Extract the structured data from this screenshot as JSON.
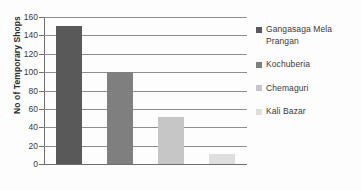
{
  "chart_data": {
    "type": "bar",
    "title": "",
    "xlabel": "",
    "ylabel": "No of Temporary Shops",
    "categories": [
      "Gangasaga Mela Prangan",
      "Kochuberia",
      "Chemaguri",
      "Kali Bazar"
    ],
    "values": [
      150,
      100,
      51,
      11
    ],
    "ylim": [
      0,
      160
    ],
    "yticks": [
      "0",
      "20",
      "40",
      "60",
      "80",
      "100",
      "120",
      "140",
      "160"
    ],
    "ytick_values": [
      0,
      20,
      40,
      60,
      80,
      100,
      120,
      140,
      160
    ],
    "grid": true,
    "grid_axis": "y",
    "xtick_labels": [],
    "legend_position": "right",
    "series_colors": [
      "#595959",
      "#7f7f7f",
      "#c6c6c6",
      "#dedede"
    ],
    "legend": [
      {
        "label": "Gangasaga Mela Prangan",
        "color": "#595959"
      },
      {
        "label": "Kochuberia",
        "color": "#7f7f7f"
      },
      {
        "label": "Chemaguri",
        "color": "#c6c6c6"
      },
      {
        "label": "Kali Bazar",
        "color": "#dedede"
      }
    ]
  }
}
